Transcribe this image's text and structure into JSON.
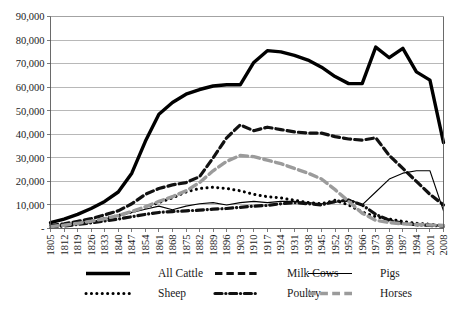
{
  "chart_data": {
    "type": "line",
    "title": "",
    "subtitle": "",
    "xlabel": "",
    "ylabel": "",
    "ylim": [
      0,
      90000
    ],
    "xlim": [
      1805,
      2008
    ],
    "grid": true,
    "legend_position": "bottom",
    "y_ticks": [
      "-",
      "10,000",
      "20,000",
      "30,000",
      "40,000",
      "50,000",
      "60,000",
      "70,000",
      "80,000",
      "90,000"
    ],
    "y_tick_values": [
      0,
      10000,
      20000,
      30000,
      40000,
      50000,
      60000,
      70000,
      80000,
      90000
    ],
    "categories": [
      "1805",
      "1812",
      "1819",
      "1826",
      "1833",
      "1840",
      "1847",
      "1854",
      "1861",
      "1868",
      "1875",
      "1882",
      "1889",
      "1896",
      "1903",
      "1910",
      "1917",
      "1924",
      "1931",
      "1938",
      "1945",
      "1952",
      "1959",
      "1966",
      "1973",
      "1980",
      "1987",
      "1994",
      "2001",
      "2008"
    ],
    "series": [
      {
        "name": "All Cattle",
        "color": "#000000",
        "style": "solid",
        "width": 3.4,
        "values": [
          2500,
          4000,
          6000,
          8500,
          11500,
          15500,
          23500,
          37000,
          48500,
          53500,
          57000,
          59000,
          60500,
          61000,
          61000,
          70500,
          75500,
          75000,
          73500,
          71500,
          68500,
          64500,
          61500,
          61500,
          77000,
          72500,
          76500,
          66500,
          63000,
          36500
        ]
      },
      {
        "name": "Milk Cows",
        "color": "#111111",
        "style": "dashed",
        "width": 3.2,
        "values": [
          1200,
          2000,
          3000,
          4200,
          5800,
          7500,
          10500,
          14500,
          17000,
          18500,
          19500,
          22000,
          30000,
          38500,
          44000,
          41500,
          43000,
          42000,
          41000,
          40500,
          40500,
          39000,
          38000,
          37500,
          38500,
          31000,
          25500,
          20000,
          14500,
          10000
        ]
      },
      {
        "name": "Pigs",
        "color": "#000000",
        "style": "thin-solid",
        "width": 1.1,
        "values": [
          900,
          1500,
          2200,
          3000,
          4000,
          5200,
          6800,
          8200,
          9500,
          8000,
          9500,
          10500,
          11000,
          10000,
          11000,
          11500,
          11000,
          11500,
          11500,
          11000,
          10500,
          11000,
          12500,
          10000,
          15500,
          21000,
          23500,
          24500,
          24500,
          7500
        ]
      },
      {
        "name": "Sheep",
        "color": "#000000",
        "style": "dotted",
        "width": 3.0,
        "values": [
          700,
          1300,
          2100,
          3000,
          4200,
          5500,
          7000,
          9000,
          11000,
          13000,
          15500,
          17000,
          17500,
          17000,
          16000,
          14500,
          13500,
          13000,
          12000,
          11000,
          10500,
          12000,
          10000,
          7000,
          5000,
          4000,
          3000,
          2200,
          1800,
          1200
        ]
      },
      {
        "name": "Poultry",
        "color": "#111111",
        "style": "dash-dot",
        "width": 3.2,
        "values": [
          600,
          1100,
          1700,
          2400,
          3200,
          4000,
          5000,
          6000,
          6800,
          7200,
          7500,
          7800,
          8200,
          8500,
          9000,
          9500,
          9800,
          10500,
          11000,
          10500,
          10000,
          11500,
          12000,
          10000,
          6000,
          3500,
          2200,
          1600,
          1300,
          1000
        ]
      },
      {
        "name": "Horses",
        "color": "#9b9b9b",
        "style": "dashed",
        "width": 3.4,
        "values": [
          800,
          1400,
          2200,
          3100,
          4200,
          5500,
          7200,
          9200,
          11500,
          13500,
          16000,
          19500,
          24500,
          28500,
          31000,
          30500,
          29000,
          27500,
          25500,
          23500,
          21000,
          16500,
          11500,
          6500,
          3500,
          2500,
          2000,
          1700,
          1500,
          1300
        ]
      }
    ]
  },
  "legend": {
    "items": [
      {
        "label": "All Cattle",
        "marker": "thick-solid-line",
        "color": "#000000"
      },
      {
        "label": "Milk Cows",
        "marker": "thick-dashed-line",
        "color": "#111111"
      },
      {
        "label": "Pigs",
        "marker": "thin-solid-line",
        "color": "#000000"
      },
      {
        "label": "Sheep",
        "marker": "dotted-line",
        "color": "#000000"
      },
      {
        "label": "Poultry",
        "marker": "thick-dash-dot-line",
        "color": "#111111"
      },
      {
        "label": "Horses",
        "marker": "thick-dashed-gray-line",
        "color": "#9b9b9b"
      }
    ]
  }
}
